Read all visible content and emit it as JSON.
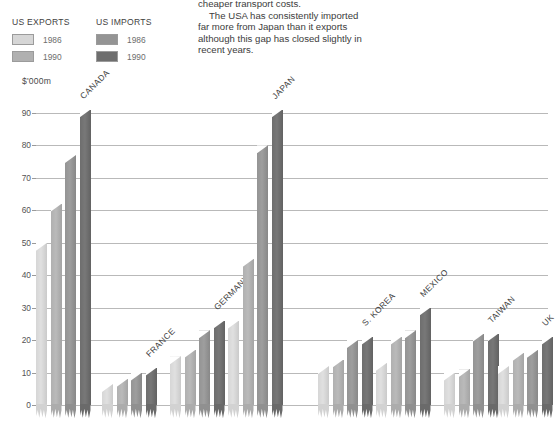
{
  "intro": {
    "lines": [
      "cheaper transport costs.",
      "The USA has consistently imported",
      "far more from Japan than it exports",
      "although this gap has closed slightly in",
      "recent years."
    ]
  },
  "legend": {
    "exports": {
      "title": "US EXPORTS",
      "items": [
        {
          "label": "1986",
          "color": "#d4d4d4"
        },
        {
          "label": "1990",
          "color": "#a8a8a8"
        }
      ]
    },
    "imports": {
      "title": "US IMPORTS",
      "color_note": "imports are darker",
      "items": [
        {
          "label": "1986",
          "color": "#9a9a9a"
        },
        {
          "label": "1990",
          "color": "#6a6a6a"
        }
      ]
    }
  },
  "axis": {
    "unit_label": "$'000m",
    "yticks": [
      0,
      10,
      20,
      30,
      40,
      50,
      60,
      70,
      80,
      90
    ],
    "ymax": 93
  },
  "chart_data": {
    "type": "bar",
    "title": "",
    "xlabel": "",
    "ylabel": "$'000m",
    "ylim": [
      0,
      93
    ],
    "grid": true,
    "legend_position": "top-left",
    "categories": [
      "CANADA",
      "FRANCE",
      "GERMANY",
      "JAPAN",
      "S. KOREA",
      "MEXICO",
      "TAIWAN",
      "UK"
    ],
    "series": [
      {
        "name": "US EXPORTS 1986",
        "color": "#d6d6d6",
        "values": [
          50,
          6.5,
          15,
          26,
          12,
          13,
          10,
          12
        ]
      },
      {
        "name": "US EXPORTS 1990",
        "color": "#b0b0b0",
        "values": [
          62,
          8,
          17,
          45,
          14,
          21,
          11,
          16
        ]
      },
      {
        "name": "US IMPORTS 1986",
        "color": "#949494",
        "values": [
          77,
          10,
          23,
          80,
          20,
          23,
          22,
          17
        ]
      },
      {
        "name": "US IMPORTS 1990",
        "color": "#6e6e6e",
        "values": [
          91,
          11.5,
          26,
          91,
          21,
          30,
          22,
          21
        ]
      }
    ]
  }
}
